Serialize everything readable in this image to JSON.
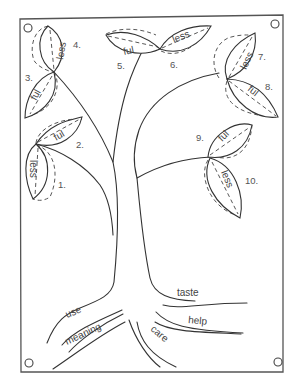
{
  "diagram": {
    "leaves": [
      {
        "number": "1.",
        "suffix": "less"
      },
      {
        "number": "2.",
        "suffix": "ful"
      },
      {
        "number": "3.",
        "suffix": "ful"
      },
      {
        "number": "4.",
        "suffix": "less"
      },
      {
        "number": "5.",
        "suffix": "ful"
      },
      {
        "number": "6.",
        "suffix": "less"
      },
      {
        "number": "7.",
        "suffix": "less"
      },
      {
        "number": "8.",
        "suffix": "ful"
      },
      {
        "number": "9.",
        "suffix": "ful"
      },
      {
        "number": "10.",
        "suffix": "less"
      }
    ],
    "roots": [
      {
        "word": "use"
      },
      {
        "word": "meaning"
      },
      {
        "word": "care"
      },
      {
        "word": "help"
      },
      {
        "word": "taste"
      }
    ],
    "colors": {
      "line": "#333333",
      "text": "#444444",
      "background": "#ffffff"
    }
  }
}
